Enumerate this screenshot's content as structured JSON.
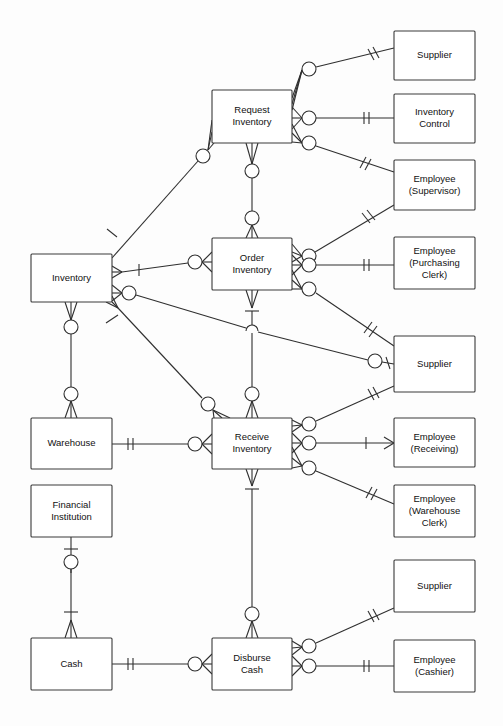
{
  "diagram": {
    "notation": "crow's-foot / IE (optional-zero circle, mandatory-one tick, many crow's foot)",
    "background_color": "#fdfdfd",
    "line_color": "#2f2f2f",
    "box_fill": "#ffffff",
    "box_stroke": "#3a3a3a",
    "entities": [
      {
        "id": "inventory",
        "label": "Inventory",
        "lines": [
          "Inventory"
        ],
        "x": 31,
        "y": 254,
        "w": 81,
        "h": 48,
        "kind": "resource"
      },
      {
        "id": "warehouse",
        "label": "Warehouse",
        "lines": [
          "Warehouse"
        ],
        "x": 31,
        "y": 418,
        "w": 81,
        "h": 51,
        "kind": "location"
      },
      {
        "id": "financial-institution",
        "label": "Financial Institution",
        "lines": [
          "Financial",
          "Institution"
        ],
        "x": 31,
        "y": 485,
        "w": 81,
        "h": 52,
        "kind": "agent"
      },
      {
        "id": "cash",
        "label": "Cash",
        "lines": [
          "Cash"
        ],
        "x": 31,
        "y": 638,
        "w": 81,
        "h": 52,
        "kind": "resource"
      },
      {
        "id": "request-inventory",
        "label": "Request Inventory",
        "lines": [
          "Request",
          "Inventory"
        ],
        "x": 212,
        "y": 90,
        "w": 80,
        "h": 53,
        "kind": "event"
      },
      {
        "id": "order-inventory",
        "label": "Order Inventory",
        "lines": [
          "Order",
          "Inventory"
        ],
        "x": 212,
        "y": 238,
        "w": 80,
        "h": 52,
        "kind": "event"
      },
      {
        "id": "receive-inventory",
        "label": "Receive Inventory",
        "lines": [
          "Receive",
          "Inventory"
        ],
        "x": 212,
        "y": 418,
        "w": 80,
        "h": 51,
        "kind": "event"
      },
      {
        "id": "disburse-cash",
        "label": "Disburse Cash",
        "lines": [
          "Disburse",
          "Cash"
        ],
        "x": 212,
        "y": 638,
        "w": 80,
        "h": 52,
        "kind": "event"
      },
      {
        "id": "supplier-1",
        "label": "Supplier",
        "lines": [
          "Supplier"
        ],
        "x": 394,
        "y": 31,
        "w": 81,
        "h": 49,
        "kind": "agent"
      },
      {
        "id": "inventory-control",
        "label": "Inventory Control",
        "lines": [
          "Inventory",
          "Control"
        ],
        "x": 394,
        "y": 94,
        "w": 81,
        "h": 49,
        "kind": "agent"
      },
      {
        "id": "employee-supervisor",
        "label": "Employee (Supervisor)",
        "lines": [
          "Employee",
          "(Supervisor)"
        ],
        "x": 394,
        "y": 160,
        "w": 81,
        "h": 50,
        "kind": "agent"
      },
      {
        "id": "employee-purchasing",
        "label": "Employee (Purchasing Clerk)",
        "lines": [
          "Employee",
          "(Purchasing",
          "Clerk)"
        ],
        "x": 394,
        "y": 237,
        "w": 81,
        "h": 52,
        "kind": "agent"
      },
      {
        "id": "supplier-2",
        "label": "Supplier",
        "lines": [
          "Supplier"
        ],
        "x": 394,
        "y": 336,
        "w": 81,
        "h": 56,
        "kind": "agent"
      },
      {
        "id": "employee-receiving",
        "label": "Employee (Receiving)",
        "lines": [
          "Employee",
          "(Receiving)"
        ],
        "x": 394,
        "y": 418,
        "w": 81,
        "h": 49,
        "kind": "agent"
      },
      {
        "id": "employee-warehouse",
        "label": "Employee (Warehouse Clerk)",
        "lines": [
          "Employee",
          "(Warehouse",
          "Clerk)"
        ],
        "x": 394,
        "y": 485,
        "w": 81,
        "h": 52,
        "kind": "agent"
      },
      {
        "id": "supplier-3",
        "label": "Supplier",
        "lines": [
          "Supplier"
        ],
        "x": 394,
        "y": 560,
        "w": 81,
        "h": 52,
        "kind": "agent"
      },
      {
        "id": "employee-cashier",
        "label": "Employee (Cashier)",
        "lines": [
          "Employee",
          "(Cashier)"
        ],
        "x": 394,
        "y": 640,
        "w": 81,
        "h": 52,
        "kind": "agent"
      }
    ],
    "relationships": [
      {
        "id": "req-supplier",
        "from": "request-inventory",
        "to": "supplier-1",
        "from_card": "zero-or-many",
        "to_card": "one"
      },
      {
        "id": "req-invctrl",
        "from": "request-inventory",
        "to": "inventory-control",
        "from_card": "zero-or-many",
        "to_card": "one"
      },
      {
        "id": "req-supervisor",
        "from": "request-inventory",
        "to": "employee-supervisor",
        "from_card": "zero-or-many",
        "to_card": "one"
      },
      {
        "id": "req-inventory",
        "from": "request-inventory",
        "to": "inventory",
        "from_card": "zero-or-many",
        "to_card": "one"
      },
      {
        "id": "req-order",
        "from": "request-inventory",
        "to": "order-inventory",
        "from_card": "zero-or-many",
        "to_card": "zero-or-many"
      },
      {
        "id": "ord-supervisor",
        "from": "order-inventory",
        "to": "employee-supervisor",
        "from_card": "zero-or-many",
        "to_card": "one"
      },
      {
        "id": "ord-purchasing",
        "from": "order-inventory",
        "to": "employee-purchasing",
        "from_card": "zero-or-many",
        "to_card": "one"
      },
      {
        "id": "ord-supplier",
        "from": "order-inventory",
        "to": "supplier-2",
        "from_card": "zero-or-many",
        "to_card": "one"
      },
      {
        "id": "ord-inventory",
        "from": "order-inventory",
        "to": "inventory",
        "from_card": "zero-or-many",
        "to_card": "one"
      },
      {
        "id": "ord-receive",
        "from": "order-inventory",
        "to": "receive-inventory",
        "from_card": "zero-or-many",
        "to_card": "one"
      },
      {
        "id": "inv-supplier",
        "from": "inventory",
        "to": "supplier-2",
        "from_card": "zero-or-many",
        "to_card": "one"
      },
      {
        "id": "inv-warehouse",
        "from": "inventory",
        "to": "warehouse",
        "from_card": "zero-or-many",
        "to_card": "zero-or-many"
      },
      {
        "id": "inv-receive",
        "from": "inventory",
        "to": "receive-inventory",
        "from_card": "zero-or-many",
        "to_card": "zero-or-many"
      },
      {
        "id": "rec-warehouse",
        "from": "receive-inventory",
        "to": "warehouse",
        "from_card": "zero-or-many",
        "to_card": "one"
      },
      {
        "id": "rec-supplier",
        "from": "receive-inventory",
        "to": "supplier-2",
        "from_card": "zero-or-many",
        "to_card": "one"
      },
      {
        "id": "rec-receiving",
        "from": "receive-inventory",
        "to": "employee-receiving",
        "from_card": "zero-or-many",
        "to_card": "one"
      },
      {
        "id": "rec-warehouseclerk",
        "from": "receive-inventory",
        "to": "employee-warehouse",
        "from_card": "zero-or-many",
        "to_card": "one"
      },
      {
        "id": "rec-disburse",
        "from": "receive-inventory",
        "to": "disburse-cash",
        "from_card": "zero-or-many",
        "to_card": "one"
      },
      {
        "id": "fin-cash",
        "from": "financial-institution",
        "to": "cash",
        "from_card": "one",
        "to_card": "zero-or-many"
      },
      {
        "id": "cash-disburse",
        "from": "cash",
        "to": "disburse-cash",
        "from_card": "one",
        "to_card": "zero-or-many"
      },
      {
        "id": "dis-supplier",
        "from": "disburse-cash",
        "to": "supplier-3",
        "from_card": "zero-or-many",
        "to_card": "one"
      },
      {
        "id": "dis-cashier",
        "from": "disburse-cash",
        "to": "employee-cashier",
        "from_card": "zero-or-many",
        "to_card": "one"
      }
    ]
  }
}
